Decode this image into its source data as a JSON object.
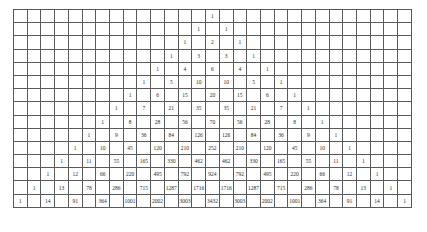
{
  "triangle": {
    "title": "",
    "columns": 29,
    "rows": [
      [
        1
      ],
      [
        1,
        1
      ],
      [
        1,
        2,
        1
      ],
      [
        1,
        3,
        3,
        1
      ],
      [
        1,
        4,
        6,
        4,
        1
      ],
      [
        1,
        5,
        10,
        10,
        5,
        1
      ],
      [
        1,
        6,
        15,
        20,
        15,
        6,
        1
      ],
      [
        1,
        7,
        21,
        35,
        35,
        21,
        7,
        1
      ],
      [
        1,
        8,
        28,
        56,
        70,
        56,
        28,
        8,
        1
      ],
      [
        1,
        9,
        36,
        84,
        126,
        126,
        84,
        36,
        9,
        1
      ],
      [
        1,
        10,
        45,
        120,
        210,
        252,
        210,
        120,
        45,
        10,
        1
      ],
      [
        1,
        11,
        55,
        165,
        330,
        462,
        462,
        330,
        165,
        55,
        11,
        1
      ],
      [
        1,
        12,
        66,
        220,
        495,
        792,
        924,
        792,
        495,
        220,
        66,
        12,
        1
      ],
      [
        1,
        13,
        78,
        286,
        715,
        1287,
        1716,
        1716,
        1287,
        715,
        286,
        78,
        13,
        1
      ],
      [
        1,
        14,
        91,
        364,
        1001,
        2002,
        3003,
        3432,
        3003,
        2002,
        1001,
        364,
        91,
        14,
        1
      ]
    ]
  },
  "colors": {
    "grid_line": "#5a5a5a",
    "text": "#2a2a2a",
    "background": "#ffffff"
  }
}
